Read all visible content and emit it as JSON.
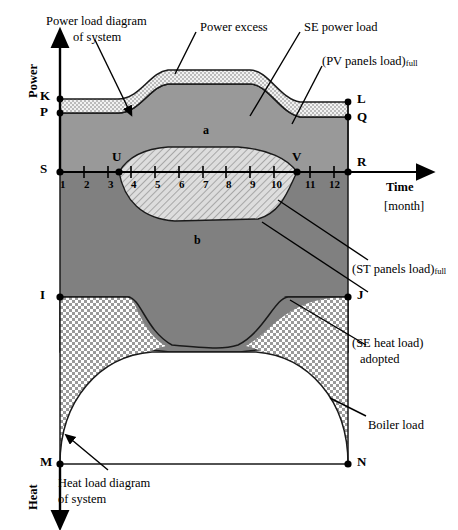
{
  "figure": {
    "axes": {
      "y_top_label": "Power",
      "y_bottom_label": "Heat",
      "x_label": "Time",
      "x_unit": "[month]",
      "x_ticks": [
        "1",
        "2",
        "3",
        "4",
        "5",
        "6",
        "7",
        "8",
        "9",
        "10",
        "11",
        "12"
      ]
    },
    "points": [
      {
        "id": "K",
        "x": 60,
        "y": 99
      },
      {
        "id": "P",
        "x": 60,
        "y": 113
      },
      {
        "id": "L",
        "x": 348,
        "y": 102
      },
      {
        "id": "Q",
        "x": 348,
        "y": 117
      },
      {
        "id": "S",
        "x": 60,
        "y": 172
      },
      {
        "id": "U",
        "x": 119,
        "y": 172
      },
      {
        "id": "V",
        "x": 297,
        "y": 172
      },
      {
        "id": "R",
        "x": 348,
        "y": 172
      },
      {
        "id": "I",
        "x": 60,
        "y": 297
      },
      {
        "id": "J",
        "x": 348,
        "y": 297
      },
      {
        "id": "M",
        "x": 60,
        "y": 464
      },
      {
        "id": "N",
        "x": 348,
        "y": 464
      }
    ],
    "region_letters": [
      {
        "id": "a",
        "x": 205,
        "y": 130
      },
      {
        "id": "b",
        "x": 196,
        "y": 240
      }
    ],
    "annotations": {
      "power_load_diagram": {
        "line1": "Power load diagram",
        "line2": "of system"
      },
      "power_excess": "Power excess",
      "se_power_load": "SE power load",
      "pv_panels_load": {
        "text": "(PV panels load)",
        "sub": "full"
      },
      "st_panels_load": {
        "text": "(ST panels load)",
        "sub": "full"
      },
      "se_heat_load": {
        "line1": "(SE heat load)",
        "line2": "adopted"
      },
      "boiler_load": "Boiler load",
      "heat_load_diagram": {
        "line1": "Heat load diagram",
        "line2": "of system"
      }
    },
    "colors": {
      "dark_gray": "#808080",
      "mid_gray": "#999999",
      "light_gray": "#d9d9d9",
      "stipple_bg": "#f0f0f0",
      "outline": "#000000",
      "white": "#ffffff"
    }
  }
}
